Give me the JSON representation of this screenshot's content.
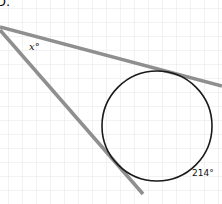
{
  "diagram": {
    "corner_text": "D.",
    "labels": {
      "angle_x": "x°",
      "arc_angle": "214°"
    },
    "colors": {
      "grid": "#e4e4e4",
      "line": "#8f8f8f",
      "circle": "#1a1a1a",
      "background": "#ffffff"
    },
    "grid_spacing_px": 14,
    "tangent_lines": [
      {
        "from": [
          0,
          27
        ],
        "to": [
          222,
          86
        ]
      },
      {
        "from": [
          0,
          30
        ],
        "to": [
          143,
          194
        ]
      }
    ],
    "circle": {
      "cx": 157,
      "cy": 126,
      "r": 55
    }
  }
}
